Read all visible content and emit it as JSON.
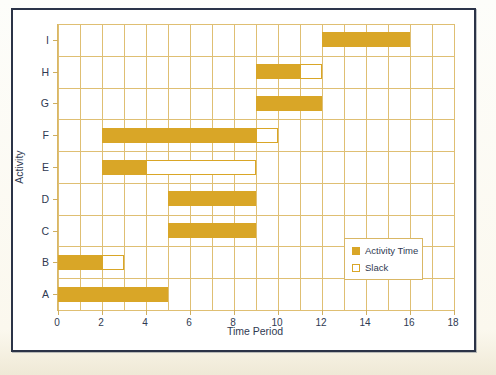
{
  "figure": {
    "accent_color": "#d9a627",
    "grid_color": "#dfbf73",
    "frame_color": "#2b3347",
    "text_color": "#2f3a52"
  },
  "legend": {
    "position": "inside-bottom-right",
    "items": [
      {
        "label": "Activity Time",
        "swatch": "filled"
      },
      {
        "label": "Slack",
        "swatch": "empty"
      }
    ]
  },
  "chart_data": {
    "type": "bar",
    "subtype": "gantt",
    "title": "",
    "xlabel": "Time Period",
    "ylabel": "Activity",
    "xlim": [
      0,
      18
    ],
    "xticks": [
      0,
      2,
      4,
      6,
      8,
      10,
      12,
      14,
      16,
      18
    ],
    "xtick_labels": [
      "0",
      "2",
      "4",
      "6",
      "8",
      "10",
      "12",
      "14",
      "16",
      "18"
    ],
    "x_minor_step": 1,
    "grid": true,
    "categories": [
      "A",
      "B",
      "C",
      "D",
      "E",
      "F",
      "G",
      "H",
      "I"
    ],
    "category_order_bottom_to_top": [
      "A",
      "B",
      "C",
      "D",
      "E",
      "F",
      "G",
      "H",
      "I"
    ],
    "series": [
      {
        "name": "Activity Time",
        "color": "#d9a627",
        "style": "filled"
      },
      {
        "name": "Slack",
        "color": "#ffffff",
        "style": "outlined"
      }
    ],
    "bars": [
      {
        "activity": "A",
        "activity_start": 0,
        "activity_end": 5,
        "activity_duration": 5,
        "slack_start": null,
        "slack_end": null,
        "slack": 0
      },
      {
        "activity": "B",
        "activity_start": 0,
        "activity_end": 2,
        "activity_duration": 2,
        "slack_start": 2,
        "slack_end": 3,
        "slack": 1
      },
      {
        "activity": "C",
        "activity_start": 5,
        "activity_end": 9,
        "activity_duration": 4,
        "slack_start": null,
        "slack_end": null,
        "slack": 0
      },
      {
        "activity": "D",
        "activity_start": 5,
        "activity_end": 9,
        "activity_duration": 4,
        "slack_start": null,
        "slack_end": null,
        "slack": 0
      },
      {
        "activity": "E",
        "activity_start": 2,
        "activity_end": 4,
        "activity_duration": 2,
        "slack_start": 4,
        "slack_end": 9,
        "slack": 5
      },
      {
        "activity": "F",
        "activity_start": 2,
        "activity_end": 9,
        "activity_duration": 7,
        "slack_start": 9,
        "slack_end": 10,
        "slack": 1
      },
      {
        "activity": "G",
        "activity_start": 9,
        "activity_end": 12,
        "activity_duration": 3,
        "slack_start": null,
        "slack_end": null,
        "slack": 0
      },
      {
        "activity": "H",
        "activity_start": 9,
        "activity_end": 11,
        "activity_duration": 2,
        "slack_start": 11,
        "slack_end": 12,
        "slack": 1
      },
      {
        "activity": "I",
        "activity_start": 12,
        "activity_end": 16,
        "activity_duration": 4,
        "slack_start": null,
        "slack_end": null,
        "slack": 0
      }
    ]
  }
}
